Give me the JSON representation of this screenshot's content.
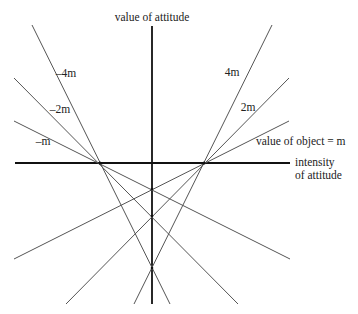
{
  "diagram": {
    "axes": {
      "vertical_label": "value of attitude",
      "horizontal_label_line1": "intensity",
      "horizontal_label_line2": "of attitude"
    },
    "rays": [
      {
        "slope_label": "4m",
        "side": "right"
      },
      {
        "slope_label": "2m",
        "side": "right"
      },
      {
        "slope_label": "value of object = m",
        "side": "right"
      },
      {
        "slope_label": "–4m",
        "side": "left"
      },
      {
        "slope_label": "–2m",
        "side": "left"
      },
      {
        "slope_label": "–m",
        "side": "left"
      }
    ],
    "line_color": "#555555",
    "axis_color": "#111111"
  }
}
